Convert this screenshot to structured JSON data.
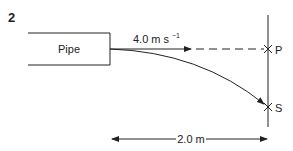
{
  "question_number": "2",
  "pipe": {
    "label": "Pipe"
  },
  "velocity": {
    "value": "4.0 m s",
    "exponent": "−1"
  },
  "points": {
    "P": "P",
    "S": "S"
  },
  "distance": {
    "label": "2.0 m"
  },
  "colors": {
    "stroke": "#222222",
    "background": "#ffffff"
  }
}
